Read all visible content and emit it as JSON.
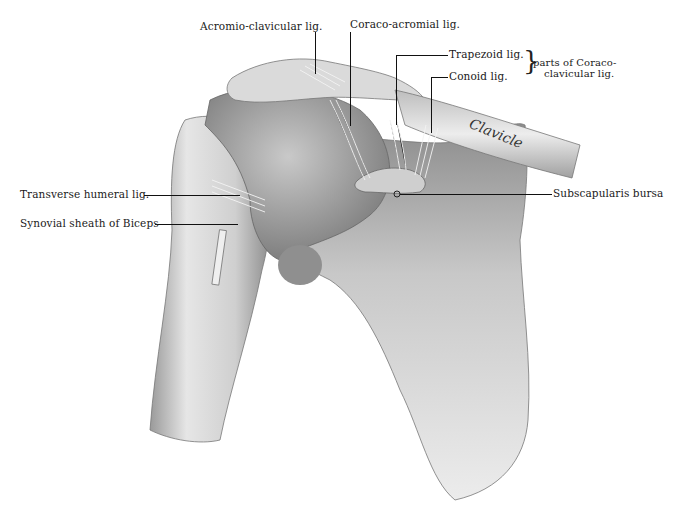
{
  "figure": {
    "bone_inscription": "Clavicle",
    "colors": {
      "background": "#ffffff",
      "ink": "#111111",
      "bone_light": "#e8e8e8",
      "bone_mid": "#b8b8b8",
      "bone_dark": "#7a7a7a"
    }
  },
  "labels": {
    "acromio_clavicular": "Acromio-clavicular lig.",
    "coraco_acromial": "Coraco-acromial lig.",
    "trapezoid": "Trapezoid  lig.",
    "conoid": "Conoid lig.",
    "coracoclavicular_group_line1": "parts of Coraco-",
    "coracoclavicular_group_line2": "clavicular lig.",
    "transverse_humeral": "Transverse humeral lig.",
    "synovial_sheath": "Synovial sheath of Biceps",
    "subscapularis_bursa": "Subscapularis bursa"
  }
}
